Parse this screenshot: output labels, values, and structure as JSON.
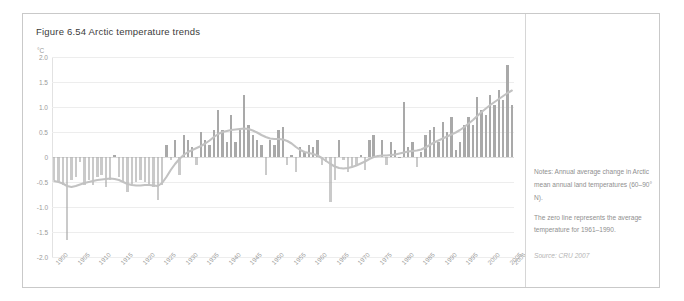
{
  "figure": {
    "title": "Figure 6.54 Arctic temperature trends",
    "unit_label": "°C"
  },
  "notes": {
    "line1": "Notes: Annual average change in Arctic mean annual land temperatures (60–90° N).",
    "line2": "The zero line represents the average temperature for 1961–1990.",
    "source": "Source: CRU 2007"
  },
  "colors": {
    "bar": "#a9a9a9",
    "trend": "#c2c2c2",
    "grid": "#ededed",
    "text": "#9a9a9a",
    "title": "#3b3b3b",
    "frame": "#c9c9c9"
  },
  "chart_data": {
    "type": "bar",
    "title": "Figure 6.54 Arctic temperature trends",
    "xlabel": "",
    "ylabel": "°C",
    "ylim": [
      -2.0,
      2.0
    ],
    "yticks": [
      "2.0",
      "1.5",
      "1.0",
      "0.5",
      "0",
      "-0.5",
      "-1.0",
      "-1.5",
      "-2.0"
    ],
    "ytick_values": [
      2.0,
      1.5,
      1.0,
      0.5,
      0,
      -0.5,
      -1.0,
      -1.5,
      -2.0
    ],
    "xticks": [
      "1900",
      "1905",
      "1910",
      "1915",
      "1920",
      "1925",
      "1930",
      "1935",
      "1940",
      "1945",
      "1950",
      "1955",
      "1960",
      "1965",
      "1970",
      "1975",
      "1980",
      "1985",
      "1990",
      "1995",
      "2000",
      "2005",
      "2006"
    ],
    "grid": true,
    "legend": "none",
    "zero_line": 0,
    "x": [
      1900,
      1901,
      1902,
      1903,
      1904,
      1905,
      1906,
      1907,
      1908,
      1909,
      1910,
      1911,
      1912,
      1913,
      1914,
      1915,
      1916,
      1917,
      1918,
      1919,
      1920,
      1921,
      1922,
      1923,
      1924,
      1925,
      1926,
      1927,
      1928,
      1929,
      1930,
      1931,
      1932,
      1933,
      1934,
      1935,
      1936,
      1937,
      1938,
      1939,
      1940,
      1941,
      1942,
      1943,
      1944,
      1945,
      1946,
      1947,
      1948,
      1949,
      1950,
      1951,
      1952,
      1953,
      1954,
      1955,
      1956,
      1957,
      1958,
      1959,
      1960,
      1961,
      1962,
      1963,
      1964,
      1965,
      1966,
      1967,
      1968,
      1969,
      1970,
      1971,
      1972,
      1973,
      1974,
      1975,
      1976,
      1977,
      1978,
      1979,
      1980,
      1981,
      1982,
      1983,
      1984,
      1985,
      1986,
      1987,
      1988,
      1989,
      1990,
      1991,
      1992,
      1993,
      1994,
      1995,
      1996,
      1997,
      1998,
      1999,
      2000,
      2001,
      2002,
      2003,
      2004,
      2005,
      2006
    ],
    "values": [
      -0.45,
      -0.5,
      -0.55,
      -1.65,
      -0.45,
      -0.4,
      -0.1,
      -0.55,
      -0.45,
      -0.55,
      -0.4,
      -0.35,
      -0.6,
      -0.45,
      0.05,
      -0.4,
      -0.5,
      -0.7,
      -0.55,
      -0.5,
      -0.45,
      -0.5,
      -0.55,
      -0.6,
      -0.85,
      -0.55,
      0.25,
      -0.05,
      0.35,
      -0.35,
      0.45,
      0.35,
      0.2,
      -0.15,
      0.5,
      0.35,
      0.25,
      0.55,
      0.95,
      0.55,
      0.3,
      0.85,
      0.3,
      0.55,
      1.25,
      0.65,
      0.45,
      0.35,
      0.25,
      -0.35,
      0.35,
      0.25,
      0.55,
      0.6,
      -0.15,
      0.05,
      -0.3,
      0.2,
      0.1,
      0.25,
      0.2,
      0.35,
      -0.15,
      -0.1,
      -0.9,
      -0.45,
      0.35,
      -0.05,
      -0.3,
      -0.2,
      -0.15,
      0.05,
      -0.25,
      0.35,
      0.45,
      0.05,
      0.35,
      -0.15,
      0.3,
      0.15,
      0.0,
      1.1,
      0.2,
      0.3,
      -0.2,
      0.1,
      0.45,
      0.55,
      0.6,
      0.3,
      0.7,
      0.5,
      0.8,
      0.15,
      0.3,
      0.65,
      0.8,
      0.65,
      1.2,
      0.95,
      0.85,
      1.25,
      1.05,
      1.35,
      1.15,
      1.85,
      1.05
    ],
    "trend_name": "smoothed decadal average",
    "trend_values": [
      -0.48,
      -0.5,
      -0.53,
      -0.58,
      -0.6,
      -0.58,
      -0.55,
      -0.52,
      -0.5,
      -0.48,
      -0.46,
      -0.45,
      -0.44,
      -0.43,
      -0.44,
      -0.46,
      -0.5,
      -0.54,
      -0.56,
      -0.57,
      -0.57,
      -0.56,
      -0.56,
      -0.57,
      -0.58,
      -0.52,
      -0.4,
      -0.26,
      -0.14,
      -0.04,
      0.04,
      0.1,
      0.14,
      0.18,
      0.22,
      0.27,
      0.33,
      0.4,
      0.46,
      0.5,
      0.52,
      0.54,
      0.55,
      0.56,
      0.57,
      0.56,
      0.53,
      0.49,
      0.44,
      0.4,
      0.37,
      0.36,
      0.36,
      0.35,
      0.32,
      0.27,
      0.2,
      0.14,
      0.1,
      0.08,
      0.06,
      0.03,
      -0.02,
      -0.08,
      -0.14,
      -0.19,
      -0.22,
      -0.23,
      -0.22,
      -0.2,
      -0.17,
      -0.13,
      -0.09,
      -0.04,
      0.0,
      0.02,
      0.03,
      0.03,
      0.04,
      0.05,
      0.07,
      0.09,
      0.11,
      0.12,
      0.13,
      0.15,
      0.19,
      0.24,
      0.29,
      0.33,
      0.37,
      0.41,
      0.45,
      0.49,
      0.54,
      0.6,
      0.67,
      0.74,
      0.82,
      0.9,
      0.97,
      1.04,
      1.1,
      1.16,
      1.22,
      1.28,
      1.33
    ]
  }
}
